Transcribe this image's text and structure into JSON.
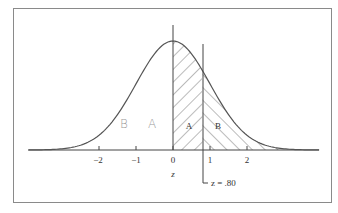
{
  "figure": {
    "title": "",
    "frame_color": "#8a8a8a",
    "curve_color": "#555555",
    "hatch_color": "#555555",
    "axis": {
      "label": "z",
      "ticks": [
        {
          "value": -2,
          "label": "−2"
        },
        {
          "value": -1,
          "label": "−1"
        },
        {
          "value": 0,
          "label": "0"
        },
        {
          "value": 1,
          "label": "1"
        },
        {
          "value": 2,
          "label": "2"
        }
      ]
    },
    "regions": [
      {
        "id": "A",
        "label": "A",
        "from": 0,
        "to": 0.8,
        "hatch": "backslash"
      },
      {
        "id": "B",
        "label": "B",
        "from": 0.8,
        "to": 3.5,
        "hatch": "slash"
      }
    ],
    "marker": {
      "value": 0.8,
      "label": "z = .80"
    },
    "handwritten_labels": [
      {
        "text": "B",
        "position": "left-tail"
      },
      {
        "text": "A",
        "position": "left-center"
      }
    ]
  },
  "chart_data": {
    "type": "area",
    "xlabel": "z",
    "ylabel": "",
    "xlim": [
      -3.9,
      4.0
    ],
    "x_ticks": [
      -2,
      -1,
      0,
      1,
      2
    ],
    "series": [
      {
        "name": "Area A (0 ≤ z ≤ 0.80)",
        "from": 0,
        "to": 0.8,
        "area": 0.2881
      },
      {
        "name": "Area B (z > 0.80)",
        "from": 0.8,
        "to": "inf",
        "area": 0.2119
      }
    ],
    "annotations": [
      "z = .80",
      "A",
      "B"
    ],
    "grid": false,
    "legend": "none"
  }
}
